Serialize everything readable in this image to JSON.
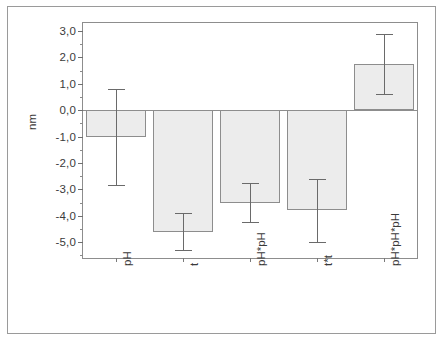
{
  "chart_data": {
    "type": "bar",
    "title": "",
    "xlabel": "",
    "ylabel": "nm",
    "categories": [
      "pH",
      "t",
      "pH*pH",
      "t*t",
      "pH*pH*pH"
    ],
    "values": [
      -1.0,
      -4.6,
      -3.5,
      -3.8,
      1.75
    ],
    "errors": [
      1.85,
      0.7,
      0.75,
      1.2,
      1.15
    ],
    "error_low": [
      -2.85,
      -5.3,
      -4.25,
      -5.0,
      0.6
    ],
    "error_high": [
      0.8,
      -3.9,
      -2.75,
      -2.6,
      2.9
    ],
    "ylim": [
      -5.6,
      3.3
    ],
    "ytick_values": [
      3.0,
      2.0,
      1.0,
      0.0,
      -1.0,
      -2.0,
      -3.0,
      -4.0,
      -5.0
    ],
    "ytick_labels": [
      "3,0",
      "2,0",
      "1,0",
      "0,0",
      "-1,0",
      "-2,0",
      "-3,0",
      "-4,0",
      "-5,0"
    ],
    "yminor_values": [
      2.5,
      1.5,
      0.5,
      -0.5,
      -1.5,
      -2.5,
      -3.5,
      -4.5,
      -5.5
    ],
    "grid": false,
    "legend": null,
    "bar_fill_color": "#ececec",
    "bar_edge_color": "#8d8d8d",
    "error_color": "#6a6a6a",
    "axis_color": "#8d8d8d",
    "background_color": "#ffffff"
  }
}
